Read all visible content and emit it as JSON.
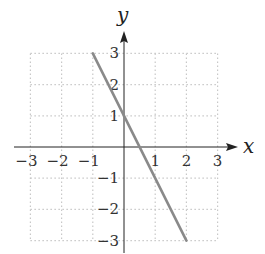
{
  "chart_data": {
    "type": "line",
    "title": "",
    "xlabel": "x",
    "ylabel": "y",
    "xlim": [
      -3,
      3
    ],
    "ylim": [
      -3,
      3
    ],
    "grid": true,
    "grid_style": "dotted",
    "x_ticks": [
      -3,
      -2,
      -1,
      1,
      2,
      3
    ],
    "y_ticks": [
      -3,
      -2,
      -1,
      1,
      2,
      3
    ],
    "x_tick_labels": [
      "−3",
      "−2",
      "−1",
      "1",
      "2",
      "3"
    ],
    "y_tick_labels": [
      "−3",
      "−2",
      "−1",
      "1",
      "2",
      "3"
    ],
    "series": [
      {
        "name": "y = -2x + 1",
        "x": [
          -1,
          2
        ],
        "y": [
          3,
          -3
        ],
        "color": "#8a8a8a"
      }
    ],
    "legend": null
  },
  "colors": {
    "axis": "#222222",
    "grid": "#c8c8c8",
    "line": "#8a8a8a"
  }
}
